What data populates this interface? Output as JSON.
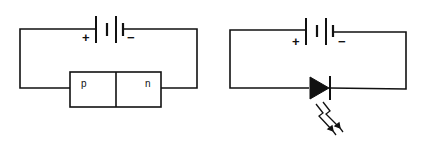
{
  "diagram": {
    "colors": {
      "ink": "#111111",
      "background": "#ffffff"
    },
    "left_circuit": {
      "battery": {
        "plus_label": "+",
        "minus_label": "−"
      },
      "junction": {
        "p_label": "p",
        "n_label": "n"
      }
    },
    "right_circuit": {
      "battery": {
        "plus_label": "+",
        "minus_label": "−"
      },
      "component": "light-emitting-diode",
      "emission_icon": "light-emission-arrows"
    }
  }
}
